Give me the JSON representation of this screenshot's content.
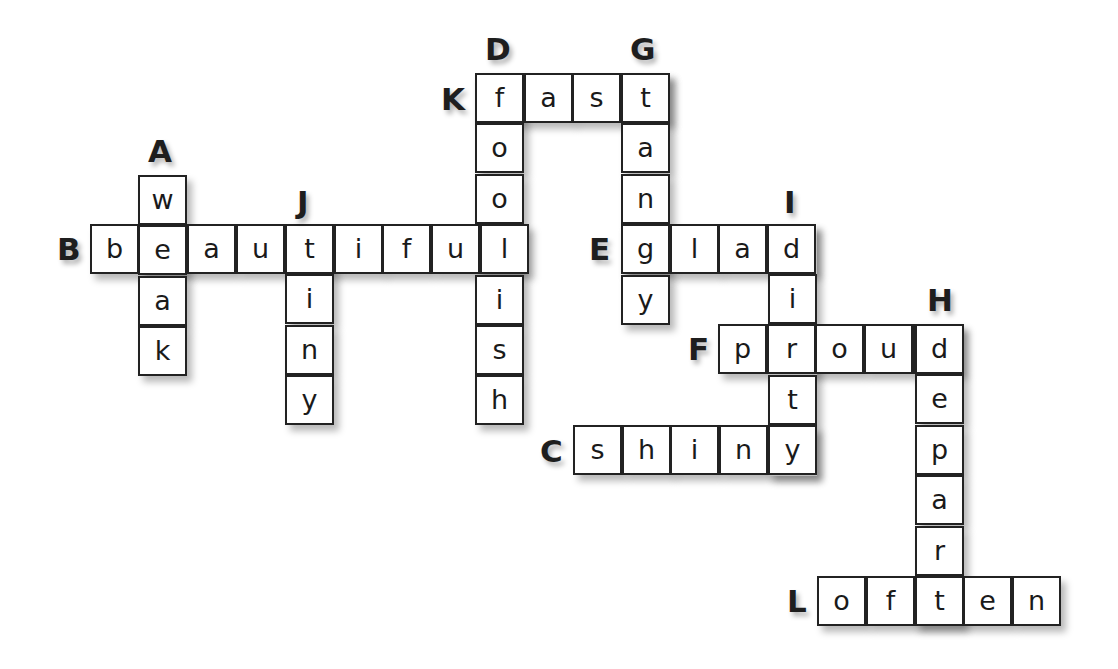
{
  "puzzle": {
    "cell_size": 49,
    "words": [
      {
        "label": "A",
        "direction": "down",
        "answer": "weak",
        "x": 139,
        "y": 176,
        "label_x": 148,
        "label_y": 136
      },
      {
        "label": "B",
        "direction": "across",
        "answer": "beautiful",
        "x": 91,
        "y": 225,
        "label_x": 57,
        "label_y": 234
      },
      {
        "label": "C",
        "direction": "across",
        "answer": "shiny",
        "x": 574,
        "y": 426,
        "label_x": 540,
        "label_y": 436
      },
      {
        "label": "D",
        "direction": "down",
        "answer": "foolish",
        "x": 476,
        "y": 74,
        "label_x": 485,
        "label_y": 34
      },
      {
        "label": "E",
        "direction": "across",
        "answer": "glad",
        "x": 622,
        "y": 225,
        "label_x": 589,
        "label_y": 234
      },
      {
        "label": "F",
        "direction": "across",
        "answer": "proud",
        "x": 719,
        "y": 325,
        "label_x": 688,
        "label_y": 334
      },
      {
        "label": "G",
        "direction": "down",
        "answer": "tangy",
        "x": 622,
        "y": 74,
        "label_x": 630,
        "label_y": 34
      },
      {
        "label": "H",
        "direction": "down",
        "answer": "depart",
        "x": 916,
        "y": 325,
        "label_x": 927,
        "label_y": 285
      },
      {
        "label": "I",
        "direction": "down",
        "answer": "dirty",
        "x": 769,
        "y": 225,
        "label_x": 784,
        "label_y": 187
      },
      {
        "label": "J",
        "direction": "down",
        "answer": "tiny",
        "x": 286,
        "y": 225,
        "label_x": 297,
        "label_y": 187
      },
      {
        "label": "K",
        "direction": "across",
        "answer": "fast",
        "x": 476,
        "y": 74,
        "label_x": 441,
        "label_y": 84
      },
      {
        "label": "L",
        "direction": "across",
        "answer": "often",
        "x": 818,
        "y": 577,
        "label_x": 787,
        "label_y": 586
      }
    ]
  }
}
